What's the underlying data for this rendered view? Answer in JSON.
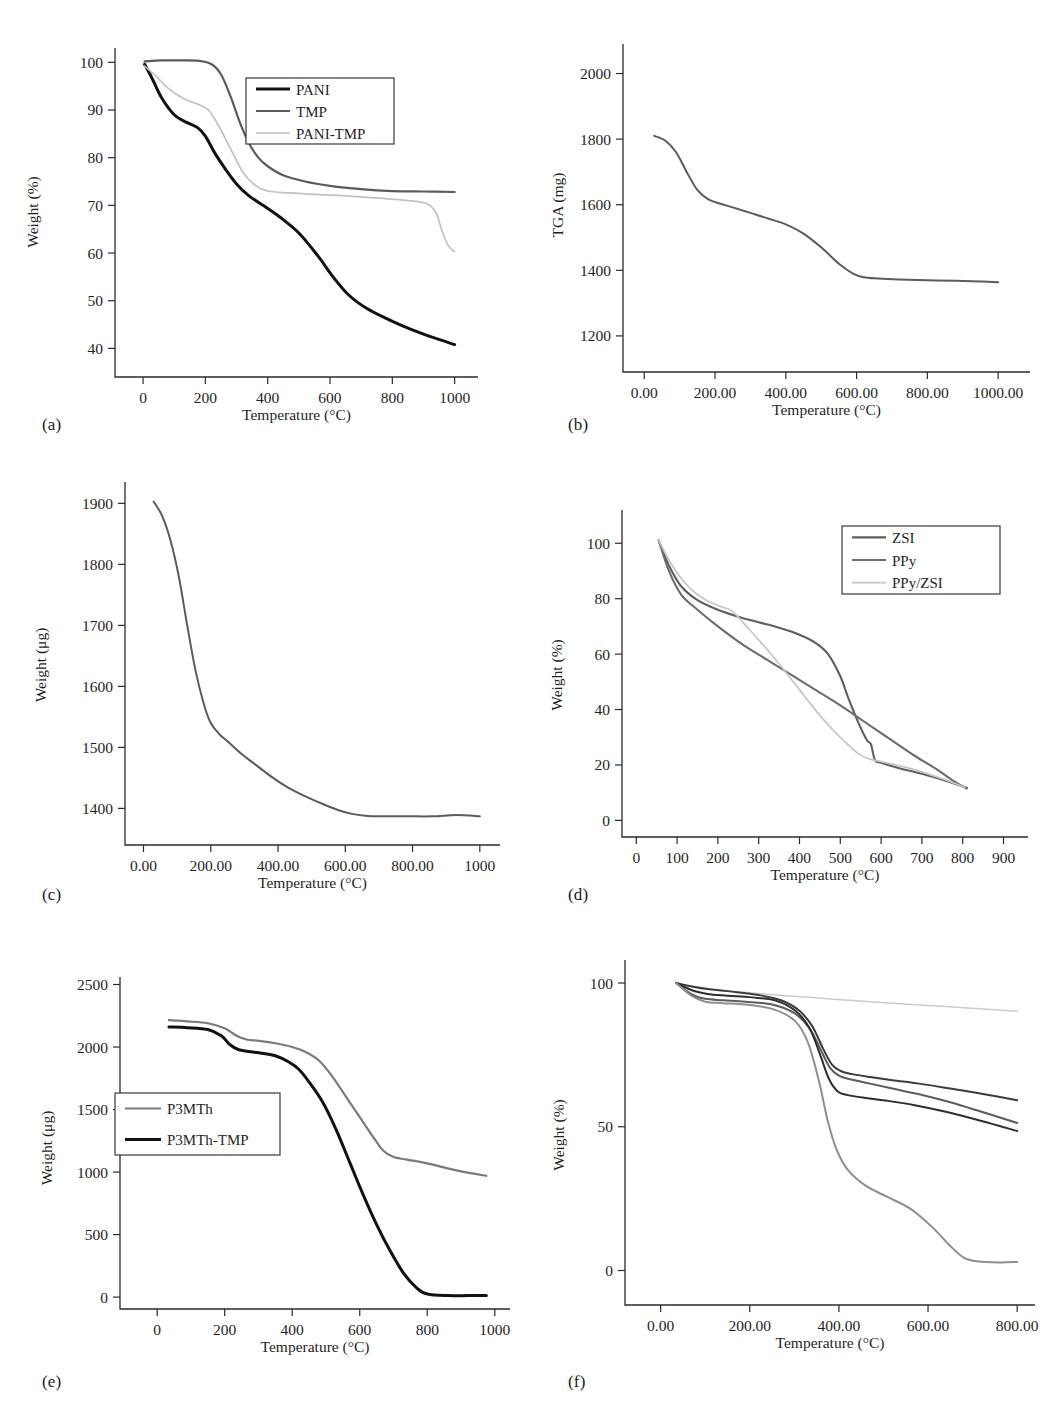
{
  "figure": {
    "kind": "six-panel thermogravimetric analysis figure",
    "panels": [
      "a",
      "b",
      "c",
      "d",
      "e",
      "f"
    ]
  },
  "captions": {
    "a": "(a)",
    "b": "(b)",
    "c": "(c)",
    "d": "(d)",
    "e": "(e)",
    "f": "(f)"
  },
  "common": {
    "xlabel": "Temperature (°C)",
    "weight_percent_label": "Weight (%)",
    "weight_microgram_label": "Weight (μg)",
    "tga_label": "TGA (mg)"
  },
  "colors": {
    "black": "#111111",
    "dark_gray": "#4a4a4a",
    "mid_gray": "#6e6e6e",
    "gray": "#8a8a8a",
    "light_gray": "#b9b9b9",
    "very_light_gray": "#cfcfcf",
    "axis": "#2b2b2b"
  },
  "chart_data": [
    {
      "panel": "a",
      "type": "line",
      "title": "",
      "xlabel": "Temperature (°C)",
      "ylabel": "Weight (%)",
      "xlim": [
        -90,
        1075
      ],
      "ylim": [
        34,
        103
      ],
      "xticks": [
        0,
        200,
        400,
        600,
        800,
        1000
      ],
      "xtick_labels": [
        "0",
        "200",
        "400",
        "600",
        "800",
        "1000"
      ],
      "yticks": [
        40,
        50,
        60,
        70,
        80,
        90,
        100
      ],
      "ytick_labels": [
        "40",
        "50",
        "60",
        "70",
        "80",
        "90",
        "100"
      ],
      "grid": false,
      "legend_position": "upper-right",
      "series": [
        {
          "name": "PANI",
          "color": "#111111",
          "width": 3.0,
          "x": [
            5,
            30,
            60,
            100,
            140,
            175,
            200,
            230,
            260,
            300,
            340,
            390,
            440,
            500,
            560,
            610,
            660,
            720,
            790,
            860,
            930,
            1000
          ],
          "y": [
            99.6,
            96.5,
            92.5,
            89.0,
            87.4,
            86.3,
            84.5,
            81.0,
            78.0,
            74.5,
            72.0,
            69.8,
            67.5,
            64.2,
            59.5,
            55.0,
            51.2,
            48.3,
            46.0,
            44.0,
            42.3,
            40.8
          ]
        },
        {
          "name": "TMP",
          "color": "#5b5b5b",
          "width": 2.2,
          "x": [
            5,
            60,
            120,
            180,
            220,
            250,
            280,
            310,
            340,
            370,
            400,
            450,
            520,
            600,
            700,
            800,
            900,
            1000
          ],
          "y": [
            100.2,
            100.4,
            100.4,
            100.3,
            99.6,
            97.5,
            93.0,
            87.5,
            83.0,
            80.0,
            78.2,
            76.3,
            75.0,
            74.1,
            73.4,
            73.0,
            72.9,
            72.8
          ]
        },
        {
          "name": "PANI-TMP",
          "color": "#c2c2c2",
          "width": 1.7,
          "x": [
            5,
            40,
            80,
            130,
            180,
            210,
            240,
            280,
            320,
            360,
            400,
            470,
            550,
            650,
            760,
            850,
            910,
            940,
            960,
            980,
            1000
          ],
          "y": [
            99.2,
            97.2,
            94.6,
            92.4,
            91.1,
            90.0,
            87.0,
            82.0,
            77.0,
            74.2,
            73.0,
            72.6,
            72.3,
            72.0,
            71.5,
            71.0,
            70.4,
            68.5,
            64.5,
            61.5,
            60.3
          ]
        }
      ]
    },
    {
      "panel": "b",
      "type": "line",
      "title": "",
      "xlabel": "Temperature (°C)",
      "ylabel": "TGA (mg)",
      "xlim": [
        -60,
        1090
      ],
      "ylim": [
        1090,
        2090
      ],
      "xticks": [
        0,
        200,
        400,
        600,
        800,
        1000
      ],
      "xtick_labels": [
        "0.00",
        "200.00",
        "400.00",
        "600.00",
        "800.00",
        "1000.00"
      ],
      "yticks": [
        1200,
        1400,
        1600,
        1800,
        2000
      ],
      "ytick_labels": [
        "1200",
        "1400",
        "1600",
        "1800",
        "2000"
      ],
      "grid": false,
      "legend_position": "none",
      "series": [
        {
          "name": "TGA curve",
          "color": "#5c5c5c",
          "width": 2.0,
          "x": [
            28,
            60,
            90,
            120,
            150,
            180,
            215,
            250,
            300,
            350,
            400,
            450,
            500,
            550,
            590,
            620,
            660,
            720,
            800,
            880,
            950,
            1000
          ],
          "y": [
            1810,
            1795,
            1760,
            1700,
            1645,
            1617,
            1603,
            1592,
            1575,
            1558,
            1540,
            1512,
            1470,
            1420,
            1390,
            1379,
            1375,
            1372,
            1370,
            1368,
            1366,
            1364
          ]
        }
      ]
    },
    {
      "panel": "c",
      "type": "line",
      "title": "",
      "xlabel": "Temperature (°C)",
      "ylabel": "Weight (μg)",
      "xlim": [
        -55,
        1060
      ],
      "ylim": [
        1340,
        1935
      ],
      "xticks": [
        0,
        200,
        400,
        600,
        800,
        1000
      ],
      "xtick_labels": [
        "0.00",
        "200.00",
        "400.00",
        "600.00",
        "800.00",
        "1000"
      ],
      "yticks": [
        1400,
        1500,
        1600,
        1700,
        1800,
        1900
      ],
      "ytick_labels": [
        "1400",
        "1500",
        "1600",
        "1700",
        "1800",
        "1900"
      ],
      "grid": false,
      "legend_position": "none",
      "series": [
        {
          "name": "Weight curve",
          "color": "#5c5c5c",
          "width": 2.0,
          "x": [
            30,
            55,
            80,
            105,
            130,
            155,
            180,
            200,
            225,
            250,
            290,
            330,
            380,
            430,
            480,
            530,
            580,
            620,
            660,
            700,
            780,
            860,
            930,
            1000
          ],
          "y": [
            1903,
            1880,
            1840,
            1780,
            1700,
            1625,
            1570,
            1540,
            1522,
            1510,
            1490,
            1473,
            1452,
            1434,
            1420,
            1408,
            1397,
            1391,
            1388,
            1387,
            1387,
            1387,
            1389,
            1387
          ]
        }
      ]
    },
    {
      "panel": "d",
      "type": "line",
      "title": "",
      "xlabel": "Temperature (°C)",
      "ylabel": "Weight (%)",
      "xlim": [
        -35,
        960
      ],
      "ylim": [
        -6,
        112
      ],
      "xticks": [
        0,
        100,
        200,
        300,
        400,
        500,
        600,
        700,
        800,
        900
      ],
      "xtick_labels": [
        "0",
        "100",
        "200",
        "300",
        "400",
        "500",
        "600",
        "700",
        "800",
        "900"
      ],
      "yticks": [
        0,
        20,
        40,
        60,
        80,
        100
      ],
      "ytick_labels": [
        "0",
        "20",
        "40",
        "60",
        "80",
        "100"
      ],
      "grid": false,
      "legend_position": "upper-right",
      "series": [
        {
          "name": "ZSI",
          "color": "#5f5f5f",
          "width": 2.1,
          "x": [
            55,
            80,
            110,
            150,
            200,
            250,
            300,
            350,
            400,
            440,
            470,
            500,
            520,
            545,
            565,
            575,
            585,
            600,
            640,
            700,
            760,
            810
          ],
          "y": [
            101.0,
            92.0,
            84.5,
            79.5,
            76.0,
            73.5,
            71.5,
            69.5,
            67.0,
            64.0,
            60.0,
            52.0,
            44.0,
            35.0,
            29.0,
            27.5,
            21.8,
            20.8,
            19.0,
            16.8,
            14.2,
            11.8
          ]
        },
        {
          "name": "PPy",
          "color": "#6d6d6d",
          "width": 2.1,
          "x": [
            55,
            80,
            110,
            150,
            200,
            260,
            320,
            380,
            440,
            500,
            560,
            620,
            680,
            730,
            780,
            810
          ],
          "y": [
            101.0,
            90.0,
            81.5,
            76.0,
            70.0,
            63.5,
            58.0,
            52.5,
            47.0,
            41.5,
            35.5,
            29.5,
            23.5,
            19.0,
            14.0,
            11.5
          ]
        },
        {
          "name": "PPy/ZSI",
          "color": "#c6c6c6",
          "width": 1.7,
          "x": [
            55,
            90,
            130,
            170,
            210,
            235,
            270,
            310,
            350,
            390,
            430,
            470,
            510,
            545,
            570,
            600,
            650,
            700,
            760,
            805
          ],
          "y": [
            101.0,
            91.5,
            84.0,
            79.5,
            77.0,
            75.5,
            70.0,
            63.5,
            56.5,
            49.0,
            41.5,
            34.5,
            28.5,
            24.0,
            22.2,
            21.2,
            19.5,
            17.5,
            14.5,
            12.0
          ]
        }
      ]
    },
    {
      "panel": "e",
      "type": "line",
      "title": "",
      "xlabel": "Temperature (°C)",
      "ylabel": "Weight (μg)",
      "xlim": [
        -110,
        1045
      ],
      "ylim": [
        -95,
        2560
      ],
      "xticks": [
        0,
        200,
        400,
        600,
        800,
        1000
      ],
      "xtick_labels": [
        "0",
        "200",
        "400",
        "600",
        "800",
        "1000"
      ],
      "yticks": [
        0,
        500,
        1000,
        1500,
        2000,
        2500
      ],
      "ytick_labels": [
        "0",
        "500",
        "1000",
        "1500",
        "2000",
        "2500"
      ],
      "grid": false,
      "legend_position": "center-left",
      "series": [
        {
          "name": "P3MTh",
          "color": "#7b7b7b",
          "width": 2.2,
          "x": [
            35,
            90,
            150,
            200,
            235,
            265,
            300,
            350,
            400,
            440,
            480,
            520,
            560,
            600,
            640,
            670,
            700,
            740,
            800,
            860,
            920,
            975
          ],
          "y": [
            2215,
            2205,
            2190,
            2150,
            2090,
            2060,
            2050,
            2030,
            2000,
            1960,
            1890,
            1760,
            1600,
            1440,
            1280,
            1170,
            1120,
            1100,
            1070,
            1030,
            995,
            970
          ]
        },
        {
          "name": "P3MTh-TMP",
          "color": "#111111",
          "width": 3.0,
          "x": [
            35,
            90,
            150,
            190,
            215,
            240,
            270,
            310,
            350,
            390,
            420,
            450,
            490,
            530,
            570,
            610,
            650,
            690,
            730,
            770,
            800,
            860,
            920,
            975
          ],
          "y": [
            2160,
            2155,
            2140,
            2090,
            2020,
            1980,
            1965,
            1950,
            1930,
            1880,
            1820,
            1720,
            1560,
            1340,
            1080,
            820,
            580,
            370,
            190,
            70,
            25,
            12,
            12,
            12
          ]
        }
      ]
    },
    {
      "panel": "f",
      "type": "line",
      "title": "",
      "xlabel": "Temperature (°C)",
      "ylabel": "Weight (%)",
      "xlim": [
        -80,
        840
      ],
      "ylim": [
        -12,
        108
      ],
      "xticks": [
        0,
        200,
        400,
        600,
        800
      ],
      "xtick_labels": [
        "0.00",
        "200.00",
        "400.00",
        "600.00",
        "800.00"
      ],
      "yticks": [
        0,
        50,
        100
      ],
      "ytick_labels": [
        "0",
        "50",
        "100"
      ],
      "grid": false,
      "legend_position": "none",
      "series": [
        {
          "name": "curve-1",
          "color": "#cbcbcb",
          "width": 1.5,
          "x": [
            35,
            80,
            130,
            200,
            280,
            360,
            440,
            520,
            600,
            680,
            760,
            800
          ],
          "y": [
            100.0,
            98.5,
            97.6,
            96.6,
            95.6,
            94.7,
            93.8,
            93.0,
            92.2,
            91.4,
            90.6,
            90.2
          ]
        },
        {
          "name": "curve-2",
          "color": "#3c3c3c",
          "width": 2.0,
          "x": [
            35,
            70,
            110,
            160,
            220,
            270,
            310,
            340,
            365,
            385,
            405,
            430,
            470,
            520,
            580,
            650,
            720,
            800
          ],
          "y": [
            100.0,
            98.8,
            97.8,
            97.0,
            95.8,
            94.0,
            90.5,
            85.0,
            77.0,
            71.5,
            69.3,
            68.3,
            67.3,
            66.2,
            65.0,
            63.3,
            61.5,
            59.2
          ]
        },
        {
          "name": "curve-3",
          "color": "#5c5c5c",
          "width": 2.0,
          "x": [
            35,
            70,
            100,
            140,
            190,
            250,
            300,
            335,
            360,
            380,
            400,
            425,
            470,
            520,
            580,
            650,
            720,
            800
          ],
          "y": [
            100.0,
            96.0,
            94.5,
            94.0,
            93.5,
            92.5,
            89.5,
            84.0,
            76.5,
            70.5,
            67.8,
            66.5,
            65.0,
            63.3,
            61.3,
            58.5,
            55.2,
            51.3
          ]
        },
        {
          "name": "curve-4",
          "color": "#2e2e2e",
          "width": 2.0,
          "x": [
            35,
            70,
            105,
            150,
            205,
            260,
            305,
            335,
            358,
            378,
            398,
            420,
            460,
            510,
            570,
            640,
            720,
            800
          ],
          "y": [
            100.0,
            97.5,
            96.2,
            95.6,
            95.0,
            93.8,
            90.0,
            84.0,
            75.0,
            66.5,
            62.2,
            61.0,
            60.0,
            59.0,
            57.5,
            55.2,
            52.0,
            48.5
          ]
        },
        {
          "name": "curve-5",
          "color": "#8f8f8f",
          "width": 2.0,
          "x": [
            35,
            70,
            100,
            140,
            190,
            250,
            300,
            330,
            355,
            375,
            395,
            420,
            460,
            510,
            560,
            610,
            650,
            680,
            710,
            760,
            800
          ],
          "y": [
            100.0,
            95.5,
            93.5,
            93.0,
            92.5,
            91.0,
            87.0,
            79.5,
            66.0,
            52.0,
            42.0,
            35.0,
            29.5,
            25.5,
            21.5,
            15.0,
            8.5,
            4.5,
            3.2,
            2.8,
            3.0
          ]
        }
      ]
    }
  ]
}
